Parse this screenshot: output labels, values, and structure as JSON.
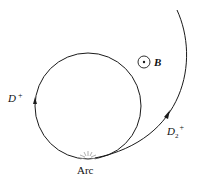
{
  "diagram": {
    "labels": {
      "d_plus": "D",
      "d_plus_sup": "+",
      "d2_plus": "D",
      "d2_plus_sub": "2",
      "d2_plus_sup": "+",
      "field": "B",
      "arc": "Arc"
    },
    "colors": {
      "stroke": "#1a1a1a",
      "spark": "#9a9a9a"
    }
  }
}
